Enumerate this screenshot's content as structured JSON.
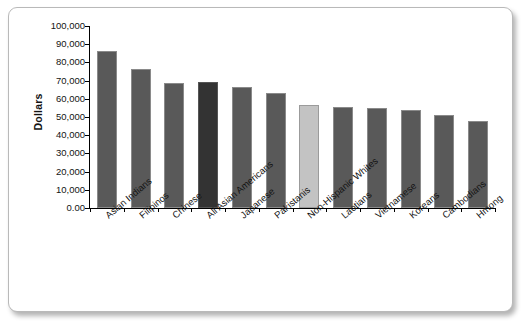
{
  "chart_data": {
    "type": "bar",
    "title": "",
    "xlabel": "",
    "ylabel": "Dollars",
    "ylim": [
      0,
      100000
    ],
    "grid": false,
    "legend": "none",
    "ytick_labels": [
      "100,000",
      "90,000",
      "80,000",
      "70,000",
      "60,000",
      "50,000",
      "40,000",
      "30,000",
      "20,000",
      "10,000",
      "0.00"
    ],
    "ytick_values": [
      100000,
      90000,
      80000,
      70000,
      60000,
      50000,
      40000,
      30000,
      20000,
      10000,
      0
    ],
    "categories": [
      "Asian Indians",
      "Filipinos",
      "Chinese",
      "All Asian Americans",
      "Japanese",
      "Pakistanis",
      "Non-Hispanic Whites",
      "Laotians",
      "Vietnamese",
      "Koreans",
      "Cambodians",
      "Hmong"
    ],
    "values": [
      86500,
      76500,
      68500,
      69000,
      66500,
      63000,
      56500,
      55500,
      55000,
      54000,
      51000,
      48000
    ],
    "bar_styles": [
      "normal",
      "normal",
      "normal",
      "dark",
      "normal",
      "normal",
      "light",
      "normal",
      "normal",
      "normal",
      "normal",
      "normal"
    ],
    "colors": {
      "bar_normal": "#595959",
      "bar_dark": "#333333",
      "bar_light": "#c3c3c3",
      "axis": "#000000",
      "text": "#131313",
      "frame_border": "#b9b9b9",
      "background": "#ffffff"
    }
  }
}
